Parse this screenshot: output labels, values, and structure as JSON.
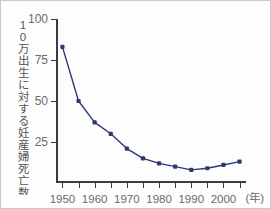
{
  "chart_data": {
    "type": "line",
    "title": "",
    "xlabel": "年",
    "ylabel": "10万出生に対する妊産婦死亡数",
    "xlim": [
      1948,
      2007
    ],
    "ylim": [
      0,
      100
    ],
    "grid": false,
    "legend": null,
    "line_color": "#2d3a72",
    "marker_color": "#2d3a72",
    "axis_color": "#3c3c3c",
    "tick_label_color": "#6b6b6b",
    "x_tick_values": [
      1950,
      1960,
      1970,
      1980,
      1990,
      2000
    ],
    "x_tick_labels": [
      "1950",
      "1960",
      "1970",
      "1980",
      "1990",
      "2000"
    ],
    "x_minor_ticks": [
      1950,
      1955,
      1960,
      1965,
      1970,
      1975,
      1980,
      1985,
      1990,
      1995,
      2000,
      2005
    ],
    "y_tick_values": [
      25,
      50,
      75,
      100
    ],
    "y_tick_labels": [
      "25",
      "50",
      "75",
      "100"
    ],
    "x": [
      1950,
      1955,
      1960,
      1965,
      1970,
      1975,
      1980,
      1985,
      1990,
      1995,
      2000,
      2005
    ],
    "values": [
      83,
      50,
      37,
      30,
      21,
      15,
      12,
      10,
      8,
      9,
      11,
      13
    ],
    "series": [
      {
        "name": "妊産婦死亡率",
        "values": [
          83,
          50,
          37,
          30,
          21,
          15,
          12,
          10,
          8,
          9,
          11,
          13
        ]
      }
    ]
  },
  "axis": {
    "x_unit_label": "(年)"
  }
}
